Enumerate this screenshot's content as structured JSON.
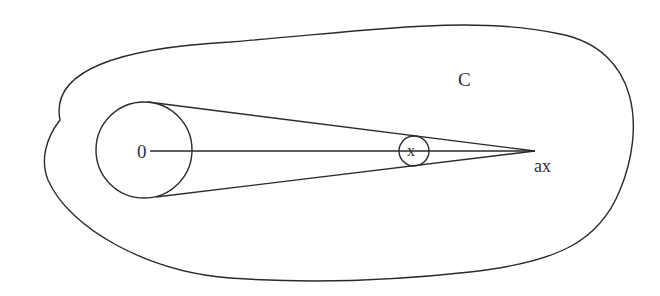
{
  "diagram": {
    "labels": {
      "origin": "0",
      "point": "x",
      "scaled_point": "ax",
      "region": "C"
    },
    "colors": {
      "stroke": "#2a2a2a",
      "text": "#333333",
      "background": "#ffffff"
    }
  }
}
